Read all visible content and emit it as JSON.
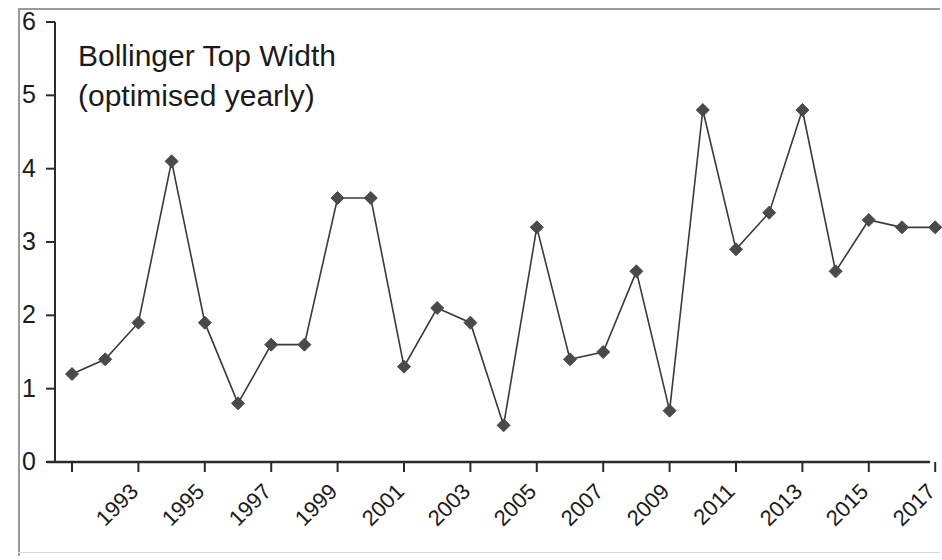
{
  "chart_data": {
    "type": "line",
    "title": "Bollinger Top Width\n(optimised yearly)",
    "title_line1": "Bollinger Top Width",
    "title_line2": "(optimised yearly)",
    "xlabel": "",
    "ylabel": "",
    "ylim": [
      0,
      6
    ],
    "yticks": [
      0,
      1,
      2,
      3,
      4,
      5,
      6
    ],
    "ytick_labels": [
      "0",
      "1",
      "2",
      "3",
      "4",
      "5",
      "6"
    ],
    "xlim": [
      1993,
      2019
    ],
    "xticks": [
      1993,
      1995,
      1997,
      1999,
      2001,
      2003,
      2005,
      2007,
      2009,
      2011,
      2013,
      2015,
      2017,
      2019
    ],
    "xtick_labels": [
      "1993",
      "1995",
      "1997",
      "1999",
      "2001",
      "2003",
      "2005",
      "2007",
      "2009",
      "2011",
      "2013",
      "2015",
      "2017",
      "2019"
    ],
    "xtick_rotation": -45,
    "grid": false,
    "legend": null,
    "marker": "diamond",
    "line_color": "#3a3a3a",
    "marker_color": "#4a4a4a",
    "categories": [
      1993,
      1994,
      1995,
      1996,
      1997,
      1998,
      1999,
      2000,
      2001,
      2002,
      2003,
      2004,
      2005,
      2006,
      2007,
      2008,
      2009,
      2010,
      2011,
      2012,
      2013,
      2014,
      2015,
      2016,
      2017,
      2018,
      2019
    ],
    "values": [
      1.2,
      1.4,
      1.9,
      4.1,
      1.9,
      0.8,
      1.6,
      1.6,
      3.6,
      3.6,
      1.3,
      2.1,
      1.9,
      0.5,
      3.2,
      1.4,
      1.5,
      2.6,
      0.7,
      4.8,
      2.9,
      3.4,
      4.8,
      2.6,
      3.3,
      3.2,
      3.2
    ],
    "series": [
      {
        "name": "Bollinger Top Width (optimised yearly)",
        "values": [
          1.2,
          1.4,
          1.9,
          4.1,
          1.9,
          0.8,
          1.6,
          1.6,
          3.6,
          3.6,
          1.3,
          2.1,
          1.9,
          0.5,
          3.2,
          1.4,
          1.5,
          2.6,
          0.7,
          4.8,
          2.9,
          3.4,
          4.8,
          2.6,
          3.3,
          3.2,
          3.2
        ]
      }
    ]
  }
}
